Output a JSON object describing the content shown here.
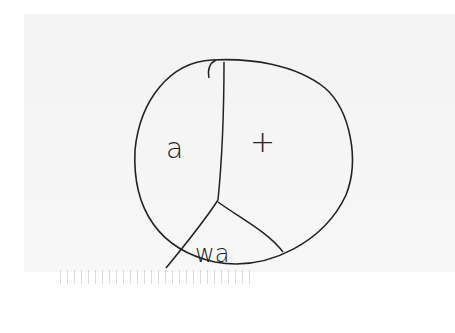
{
  "diagram": {
    "type": "hand-drawn circle partition",
    "regions": [
      {
        "id": "left",
        "label": "a"
      },
      {
        "id": "right",
        "label": "+"
      },
      {
        "id": "bottom",
        "label": "wa"
      }
    ],
    "stroke_color": "#222222",
    "background_color": "#f5f5f5"
  }
}
